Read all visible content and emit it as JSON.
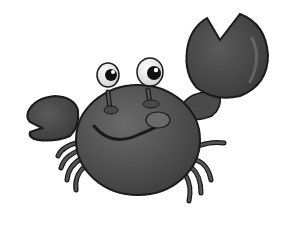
{
  "image": {
    "subject": "Cartoon crab",
    "description": "Grayscale cartoon crab with eyes on stalks, a smiling face, one large raised pincer and one smaller pincer",
    "background": "#ffffff"
  },
  "colors": {
    "body": "#555555",
    "body_dark": "#3a3a3a",
    "outline": "#1a1a1a",
    "highlight": "#7a7a7a",
    "eye_white": "#f2f2f2",
    "pupil": "#111111",
    "background": "#ffffff"
  }
}
